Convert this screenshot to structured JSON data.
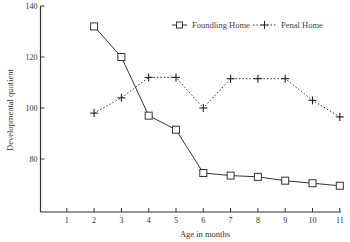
{
  "chart_data": {
    "type": "line",
    "title": "",
    "xlabel": "Age in months",
    "ylabel": "Developmental quotient",
    "x": [
      1,
      2,
      3,
      4,
      5,
      6,
      7,
      8,
      9,
      10,
      11
    ],
    "x_ticks": [
      "1",
      "2",
      "3",
      "4",
      "5",
      "6",
      "7",
      "8",
      "9",
      "10",
      "11"
    ],
    "y_ticks": [
      "80",
      "100",
      "120",
      "140"
    ],
    "xlim": [
      0,
      11
    ],
    "ylim": [
      60,
      140
    ],
    "grid": false,
    "legend_position": "top-right",
    "series": [
      {
        "name": "Foundling Home",
        "marker": "square",
        "line_style": "solid",
        "x": [
          2,
          3,
          4,
          5,
          6,
          7,
          8,
          9,
          10,
          11
        ],
        "values": [
          132,
          120,
          97,
          91.5,
          74.5,
          73.5,
          73,
          71.5,
          70.5,
          69.5
        ]
      },
      {
        "name": "Penal Home",
        "marker": "plus",
        "line_style": "dotted",
        "x": [
          2,
          3,
          4,
          5,
          6,
          7,
          8,
          9,
          10,
          11
        ],
        "values": [
          98,
          104,
          112,
          112,
          100,
          111.5,
          111.5,
          111.5,
          103,
          96.5
        ]
      }
    ]
  },
  "colors": {
    "axis": "#333333",
    "series_line": "#333333",
    "background": "#ffffff"
  }
}
